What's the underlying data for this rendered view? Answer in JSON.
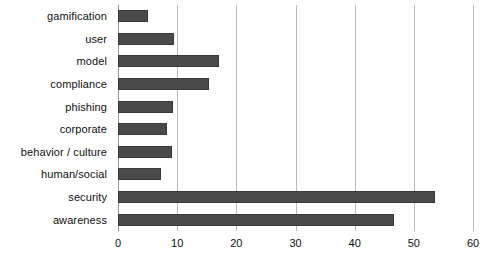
{
  "chart_data": {
    "type": "bar",
    "orientation": "horizontal",
    "title": "",
    "subtitle": "",
    "xlabel": "",
    "ylabel": "",
    "xlim": [
      0,
      60
    ],
    "xticks": [
      0,
      10,
      20,
      30,
      40,
      50,
      60
    ],
    "grid": true,
    "legend": false,
    "legend_position": "none",
    "bar_color": "#4a4a4a",
    "bar_edge_color": "#3a3a3a",
    "gridline_color": "#b9b9b9",
    "background_color": "#ffffff",
    "categories": [
      "gamification",
      "user",
      "model",
      "compliance",
      "phishing",
      "corporate",
      "behavior / culture",
      "human/social",
      "security",
      "awareness"
    ],
    "values": [
      5,
      9.5,
      17,
      15.4,
      9.3,
      8.3,
      9.1,
      7.3,
      53.5,
      46.6
    ],
    "series": [
      {
        "name": "count",
        "values": [
          5,
          9.5,
          17,
          15.4,
          9.3,
          8.3,
          9.1,
          7.3,
          53.5,
          46.6
        ]
      }
    ]
  }
}
